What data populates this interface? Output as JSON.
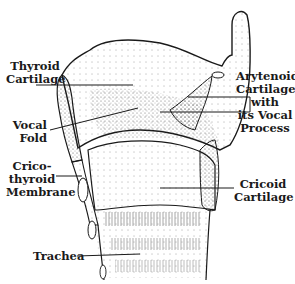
{
  "diagram": {
    "type": "anatomical-illustration",
    "labels": {
      "thyroid_cartilage": [
        "Thyroid",
        "Cartilage"
      ],
      "vocal_fold": [
        "Vocal",
        "Fold"
      ],
      "cricothyroid_membrane": [
        "Crico-",
        "thyroid",
        "Membrane"
      ],
      "trachea": [
        "Trachea"
      ],
      "arytenoid_cartilage": [
        "Arytenoid",
        "Cartilage",
        "with",
        "its Vocal",
        "Process"
      ],
      "cricoid_cartilage": [
        "Cricoid",
        "Cartilage"
      ]
    },
    "colors": {
      "ink": "#1a1a1a",
      "background": "#ffffff"
    }
  }
}
